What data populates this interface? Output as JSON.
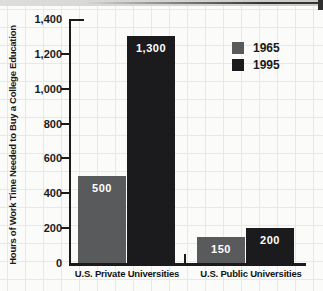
{
  "chart_data": {
    "type": "bar",
    "title": "",
    "xlabel": "",
    "ylabel": "Hours of Work Time Needed to Buy a College Education",
    "categories": [
      "U.S. Private Universities",
      "U.S. Public Universities"
    ],
    "series": [
      {
        "name": "1965",
        "color": "#595a5c",
        "values": [
          500,
          150
        ],
        "value_labels": [
          "500",
          "150"
        ]
      },
      {
        "name": "1995",
        "color": "#1b1b1d",
        "values": [
          1300,
          200
        ],
        "value_labels": [
          "1,300",
          "200"
        ]
      }
    ],
    "ylim": [
      0,
      1400
    ],
    "ytick_interval": 200,
    "yticks": [
      {
        "value": 0,
        "label": "0"
      },
      {
        "value": 200,
        "label": "200"
      },
      {
        "value": 400,
        "label": "400"
      },
      {
        "value": 600,
        "label": "600"
      },
      {
        "value": 800,
        "label": "800"
      },
      {
        "value": 1000,
        "label": "1,000"
      },
      {
        "value": 1200,
        "label": "1,200"
      },
      {
        "value": 1400,
        "label": "1,400"
      }
    ],
    "legend_position": "top-right",
    "grid": true,
    "bar_label_color": "#ffffff",
    "axis_color": "#1a1a1a"
  }
}
